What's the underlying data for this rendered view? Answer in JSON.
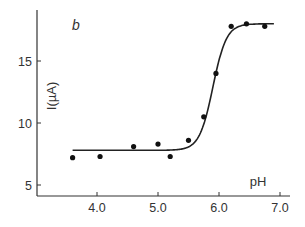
{
  "chart_data": {
    "type": "scatter",
    "title": "",
    "panel_label": "b",
    "xlabel": "pH",
    "ylabel": "I(µA)",
    "xlim": [
      3.3,
      7.2
    ],
    "ylim": [
      4,
      19.5
    ],
    "x_ticks": [
      4.0,
      5.0,
      6.0,
      7.0
    ],
    "x_tick_labels": [
      "4.0",
      "5.0",
      "6.0",
      "7.0"
    ],
    "y_ticks": [
      5,
      10,
      15
    ],
    "y_tick_labels": [
      "5",
      "10",
      "15"
    ],
    "grid": false,
    "series": [
      {
        "name": "measured",
        "kind": "points",
        "x": [
          3.6,
          4.05,
          4.6,
          5.0,
          5.2,
          5.5,
          5.75,
          5.95,
          6.2,
          6.45,
          6.75
        ],
        "y": [
          7.2,
          7.3,
          8.1,
          8.3,
          7.3,
          8.6,
          10.5,
          14.0,
          17.8,
          18.0,
          17.8
        ]
      },
      {
        "name": "fit",
        "kind": "sigmoid-line",
        "x_range": [
          3.6,
          6.9
        ],
        "low": 7.8,
        "high": 18.0,
        "midpoint": 5.9,
        "slope": 9.0
      }
    ]
  }
}
